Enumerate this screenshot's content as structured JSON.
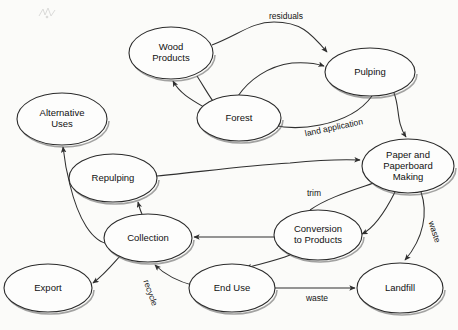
{
  "diagram": {
    "type": "flow-diagram",
    "background_color": "#fbfbf9",
    "node_fill_color": "#fdfdfc",
    "node_stroke_color": "#2b2b2b",
    "edge_color": "#2f2f2f",
    "text_color": "#111111",
    "nodes": [
      {
        "id": "wood-products",
        "label": "Wood\nProducts",
        "line1": "Wood",
        "line2": "Products",
        "line3": "",
        "cx": 171,
        "cy": 53,
        "rx": 42,
        "ry": 26
      },
      {
        "id": "pulping",
        "label": "Pulping",
        "line1": "Pulping",
        "line2": "",
        "line3": "",
        "cx": 370,
        "cy": 72,
        "rx": 45,
        "ry": 24
      },
      {
        "id": "forest",
        "label": "Forest",
        "line1": "Forest",
        "line2": "",
        "line3": "",
        "cx": 239,
        "cy": 118,
        "rx": 42,
        "ry": 23
      },
      {
        "id": "alternative-uses",
        "label": "Alternative\nUses",
        "line1": "Alternative",
        "line2": "Uses",
        "line3": "",
        "cx": 62,
        "cy": 119,
        "rx": 45,
        "ry": 26
      },
      {
        "id": "paper-making",
        "label": "Paper and\nPaperboard\nMaking",
        "line1": "Paper and",
        "line2": "Paperboard",
        "line3": "Making",
        "cx": 408,
        "cy": 166,
        "rx": 46,
        "ry": 27
      },
      {
        "id": "repulping",
        "label": "Repulping",
        "line1": "Repulping",
        "line2": "",
        "line3": "",
        "cx": 113,
        "cy": 178,
        "rx": 44,
        "ry": 24
      },
      {
        "id": "collection",
        "label": "Collection",
        "line1": "Collection",
        "line2": "",
        "line3": "",
        "cx": 148,
        "cy": 238,
        "rx": 44,
        "ry": 24
      },
      {
        "id": "conversion",
        "label": "Conversion\nto Products",
        "line1": "Conversion",
        "line2": "to Products",
        "line3": "",
        "cx": 318,
        "cy": 235,
        "rx": 44,
        "ry": 25
      },
      {
        "id": "export",
        "label": "Export",
        "line1": "Export",
        "line2": "",
        "line3": "",
        "cx": 48,
        "cy": 288,
        "rx": 44,
        "ry": 24
      },
      {
        "id": "end-use",
        "label": "End Use",
        "line1": "End Use",
        "line2": "",
        "line3": "",
        "cx": 232,
        "cy": 288,
        "rx": 43,
        "ry": 24
      },
      {
        "id": "landfill",
        "label": "Landfill",
        "line1": "Landfill",
        "line2": "",
        "line3": "",
        "cx": 400,
        "cy": 288,
        "rx": 43,
        "ry": 25
      }
    ],
    "edges": [
      {
        "id": "wood-products-to-pulping",
        "from": "wood-products",
        "to": "pulping",
        "label": "residuals",
        "label_x": 286,
        "label_y": 17,
        "rotate": 0
      },
      {
        "id": "wood-products-to-forest",
        "from": "wood-products",
        "to": "forest",
        "label": "",
        "label_x": 0,
        "label_y": 0,
        "rotate": 0
      },
      {
        "id": "forest-to-wood-products",
        "from": "forest",
        "to": "wood-products",
        "label": "",
        "label_x": 0,
        "label_y": 0,
        "rotate": 0
      },
      {
        "id": "forest-to-pulping",
        "from": "forest",
        "to": "pulping",
        "label": "",
        "label_x": 0,
        "label_y": 0,
        "rotate": 0
      },
      {
        "id": "pulping-to-forest",
        "from": "pulping",
        "to": "forest",
        "label": "land application",
        "label_x": 334,
        "label_y": 128,
        "rotate": -12
      },
      {
        "id": "pulping-to-paper-making",
        "from": "pulping",
        "to": "paper-making",
        "label": "",
        "label_x": 0,
        "label_y": 0,
        "rotate": 0
      },
      {
        "id": "repulping-to-paper-making",
        "from": "repulping",
        "to": "paper-making",
        "label": "",
        "label_x": 0,
        "label_y": 0,
        "rotate": 0
      },
      {
        "id": "paper-making-to-conversion",
        "from": "paper-making",
        "to": "conversion",
        "label": "",
        "label_x": 0,
        "label_y": 0,
        "rotate": 0
      },
      {
        "id": "conversion-to-paper-making",
        "from": "conversion",
        "to": "paper-making",
        "label": "trim",
        "label_x": 314,
        "label_y": 194,
        "rotate": 0
      },
      {
        "id": "paper-making-to-landfill",
        "from": "paper-making",
        "to": "landfill",
        "label": "waste",
        "label_x": 434,
        "label_y": 232,
        "rotate": 72
      },
      {
        "id": "conversion-to-collection",
        "from": "conversion",
        "to": "collection",
        "label": "",
        "label_x": 0,
        "label_y": 0,
        "rotate": 0
      },
      {
        "id": "conversion-to-end-use",
        "from": "conversion",
        "to": "end-use",
        "label": "",
        "label_x": 0,
        "label_y": 0,
        "rotate": 0
      },
      {
        "id": "end-use-to-landfill",
        "from": "end-use",
        "to": "landfill",
        "label": "waste",
        "label_x": 317,
        "label_y": 299,
        "rotate": 0
      },
      {
        "id": "end-use-to-collection",
        "from": "end-use",
        "to": "collection",
        "label": "recycle",
        "label_x": 150,
        "label_y": 293,
        "rotate": 70
      },
      {
        "id": "collection-to-repulping",
        "from": "collection",
        "to": "repulping",
        "label": "",
        "label_x": 0,
        "label_y": 0,
        "rotate": 0
      },
      {
        "id": "collection-to-alternative-uses",
        "from": "collection",
        "to": "alternative-uses",
        "label": "",
        "label_x": 0,
        "label_y": 0,
        "rotate": 0
      },
      {
        "id": "collection-to-export",
        "from": "collection",
        "to": "export",
        "label": "",
        "label_x": 0,
        "label_y": 0,
        "rotate": 0
      }
    ],
    "edge_paths": {
      "wood-products-to-pulping": "M 212 45 C 240 34, 252 22, 274 22 C 300 22, 310 32, 327 52",
      "wood-products-to-forest": "M 197 76 C 206 90, 210 98, 216 105",
      "forest-to-wood-products": "M 209 110 C 192 100, 180 94, 173 81",
      "forest-to-pulping": "M 238 96 C 249 80, 268 66, 292 63 C 306 62, 315 63, 324 66",
      "pulping-to-forest": "M 372 96 C 362 110, 345 120, 320 125 C 300 129, 285 128, 273 125",
      "pulping-to-paper-making": "M 394 93 C 400 108, 396 122, 406 137",
      "repulping-to-paper-making": "M 157 176 C 200 172, 240 166, 290 163 C 320 160, 340 159, 360 160",
      "paper-making-to-conversion": "M 395 192 C 384 214, 374 228, 362 234",
      "conversion-to-paper-making": "M 310 210 C 324 200, 344 193, 365 186 C 375 183, 380 180, 385 176",
      "paper-making-to-landfill": "M 421 192 C 428 212, 424 238, 405 260",
      "conversion-to-collection": "M 274 237 C 250 237, 220 237, 194 237",
      "conversion-to-end-use": "M 290 255 C 278 260, 260 264, 246 268",
      "end-use-to-landfill": "M 275 288 C 300 288, 330 288, 355 288",
      "end-use-to-collection": "M 195 286 C 180 282, 165 275, 155 265",
      "collection-to-repulping": "M 142 214 C 140 210, 139 206, 138 202",
      "collection-to-alternative-uses": "M 110 244 C 92 243, 78 218, 70 185 C 66 170, 64 156, 63 147",
      "collection-to-export": "M 121 255 C 112 265, 104 275, 93 283"
    }
  }
}
